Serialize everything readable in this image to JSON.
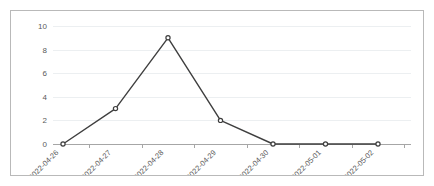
{
  "chart_data": {
    "type": "line",
    "title": "",
    "subtitle": "",
    "xlabel": "",
    "ylabel": "",
    "categories": [
      "2022-04-26",
      "2022-04-27",
      "2022-04-28",
      "2022-04-29",
      "2022-04-30",
      "2022-05-01",
      "2022-05-02"
    ],
    "values": [
      0,
      3,
      9,
      2,
      0,
      0,
      0
    ],
    "series": [
      {
        "name": "",
        "values": [
          0,
          3,
          9,
          2,
          0,
          0,
          0
        ]
      }
    ],
    "ylim": [
      0,
      10
    ],
    "y_ticks": [
      0,
      2,
      4,
      6,
      8,
      10
    ],
    "y_tick_labels": [
      "0",
      "2",
      "4",
      "6",
      "8",
      "10"
    ],
    "grid": true,
    "grid_axis": "y",
    "legend": false,
    "legend_position": "none",
    "marker": "circle",
    "x_tick_label_rotation": -45,
    "colors": {
      "line": "#3f3f3f",
      "marker_fill": "#ffffff",
      "marker_stroke": "#3f3f3f",
      "gridline": "#eceff1",
      "axis": "#a6a6a6",
      "tick_text": "#595959",
      "border": "#b9b9b9",
      "background": "#ffffff"
    }
  }
}
